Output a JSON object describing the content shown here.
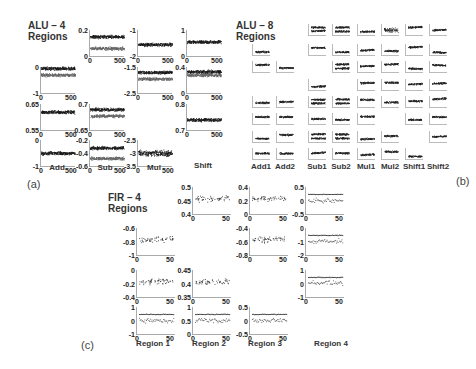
{
  "panels": {
    "a": {
      "label": "(a)",
      "title_line1": "ALU – 4",
      "title_line2": "Regions",
      "columns": [
        "Add",
        "Sub",
        "Mul",
        "Shift"
      ]
    },
    "b": {
      "label": "(b)",
      "title_line1": "ALU – 8",
      "title_line2": "Regions",
      "columns": [
        "Add1",
        "Add2",
        "Sub1",
        "Sub2",
        "Mul1",
        "Mul2",
        "Shift1",
        "Shift2"
      ]
    },
    "c": {
      "label": "(c)",
      "title_line1": "FIR – 4",
      "title_line2": "Regions",
      "columns": [
        "Region 1",
        "Region 2",
        "Region 3",
        "Region 4"
      ]
    }
  },
  "chart_data": [
    {
      "type": "scatter",
      "title": "ALU - 4 Regions",
      "panel": "(a)",
      "subplots": [
        {
          "column": "Add",
          "row": 2,
          "xlim": [
            0,
            500
          ],
          "ylim": [
            -1,
            0
          ],
          "yticks": [
            "0",
            "-1"
          ],
          "xticks": [
            "0",
            "500"
          ],
          "series_levels": [
            -0.05,
            -0.3
          ]
        },
        {
          "column": "Add",
          "row": 3,
          "xlim": [
            0,
            500
          ],
          "ylim": [
            0.55,
            0.65
          ],
          "yticks": [
            "0.65",
            "0.55"
          ],
          "xticks": [
            "0",
            "500"
          ],
          "series_levels": [
            0.62
          ]
        },
        {
          "column": "Add",
          "row": 4,
          "xlim": [
            0,
            500
          ],
          "ylim": [
            -1,
            0
          ],
          "yticks": [
            "0",
            "-1"
          ],
          "xticks": [
            "0",
            "500"
          ],
          "series_levels": [
            -0.5
          ]
        },
        {
          "column": "Sub",
          "row": 1,
          "xlim": [
            0,
            500
          ],
          "ylim": [
            0,
            0.2
          ],
          "yticks": [
            "0.2",
            "0"
          ],
          "xticks": [
            "0",
            "500"
          ],
          "series_levels": [
            0.15,
            0.06
          ]
        },
        {
          "column": "Sub",
          "row": 3,
          "xlim": [
            0,
            500
          ],
          "ylim": [
            0.6,
            0.7
          ],
          "yticks": [
            "0.7",
            "0.65"
          ],
          "xticks": [
            "0",
            "500"
          ],
          "series_levels": [
            0.68,
            0.655
          ]
        },
        {
          "column": "Sub",
          "row": 4,
          "xlim": [
            0,
            500
          ],
          "ylim": [
            -0.6,
            -0.2
          ],
          "yticks": [
            "-0.2",
            "-0.4",
            "-0.6"
          ],
          "xticks": [
            "0",
            "500"
          ],
          "series_levels": [
            -0.32,
            -0.48
          ]
        },
        {
          "column": "Mul",
          "row": 1,
          "xlim": [
            0,
            500
          ],
          "ylim": [
            -2,
            -1
          ],
          "yticks": [
            "-1",
            "-2"
          ],
          "xticks": [
            "0",
            "500"
          ],
          "series_levels": [
            -1.55
          ]
        },
        {
          "column": "Mul",
          "row": 2,
          "xlim": [
            0,
            500
          ],
          "ylim": [
            -2.5,
            -1.5
          ],
          "yticks": [
            "-1.5",
            "-2.5"
          ],
          "xticks": [
            "0",
            "500"
          ],
          "series_levels": [
            -1.7,
            -1.95
          ]
        },
        {
          "column": "Mul",
          "row": 4,
          "xlim": [
            0,
            500
          ],
          "ylim": [
            -3.5,
            -2.5
          ],
          "yticks": [
            "-2.5",
            "-3",
            "-3.5"
          ],
          "xticks": [
            "0",
            "500"
          ],
          "series_levels": [
            -3.0
          ]
        },
        {
          "column": "Shift",
          "row": 1,
          "xlim": [
            0,
            500
          ],
          "ylim": [
            0,
            1
          ],
          "yticks": [
            "1",
            "0"
          ],
          "xticks": [
            "0",
            "500"
          ],
          "series_levels": [
            0.55
          ]
        },
        {
          "column": "Shift",
          "row": 2,
          "xlim": [
            0,
            500
          ],
          "ylim": [
            0,
            0.4
          ],
          "yticks": [
            "0.4",
            "0"
          ],
          "xticks": [
            "0",
            "500"
          ],
          "series_levels": [
            0.33,
            0.28
          ]
        },
        {
          "column": "Shift",
          "row": 3,
          "xlim": [
            0,
            500
          ],
          "ylim": [
            0.7,
            0.8
          ],
          "yticks": [
            "0.8",
            "0.7"
          ],
          "xticks": [
            "0",
            "500"
          ],
          "series_levels": [
            0.74
          ]
        }
      ]
    },
    {
      "type": "scatter",
      "title": "ALU - 8 Regions",
      "panel": "(b)",
      "note": "8x8 grid of small scatter plots; tick labels too small to read",
      "columns": [
        "Add1",
        "Add2",
        "Sub1",
        "Sub2",
        "Mul1",
        "Mul2",
        "Shift1",
        "Shift2"
      ]
    },
    {
      "type": "scatter",
      "title": "FIR - 4 Regions",
      "panel": "(c)",
      "subplots": [
        {
          "column": "Region 1",
          "row": 2,
          "xlim": [
            0,
            50
          ],
          "ylim": [
            -1,
            -0.6
          ],
          "yticks": [
            "-0.6",
            "-0.8",
            "-1"
          ],
          "xticks": [
            "0",
            "50"
          ]
        },
        {
          "column": "Region 1",
          "row": 3,
          "xlim": [
            0,
            50
          ],
          "ylim": [
            -0.4,
            0
          ],
          "yticks": [
            "0",
            "-0.2",
            "-0.4"
          ],
          "xticks": [
            "0",
            "50"
          ]
        },
        {
          "column": "Region 1",
          "row": 4,
          "xlim": [
            0,
            50
          ],
          "ylim": [
            -1,
            1
          ],
          "yticks": [
            "1",
            "0",
            "-1"
          ],
          "xticks": [
            "0",
            "50"
          ]
        },
        {
          "column": "Region 2",
          "row": 1,
          "xlim": [
            0,
            50
          ],
          "ylim": [
            0.4,
            0.5
          ],
          "yticks": [
            "0.5",
            "0.45",
            "0.4"
          ],
          "xticks": [
            "0",
            "50"
          ]
        },
        {
          "column": "Region 2",
          "row": 3,
          "xlim": [
            0,
            50
          ],
          "ylim": [
            0.35,
            0.45
          ],
          "yticks": [
            "0.45",
            "0.4",
            "0.35"
          ],
          "xticks": [
            "0",
            "50"
          ]
        },
        {
          "column": "Region 2",
          "row": 4,
          "xlim": [
            0,
            50
          ],
          "ylim": [
            0,
            1
          ],
          "yticks": [
            "1",
            "0.5",
            "0"
          ],
          "xticks": [
            "0",
            "50"
          ]
        },
        {
          "column": "Region 3",
          "row": 1,
          "xlim": [
            0,
            50
          ],
          "ylim": [
            0,
            0.4
          ],
          "yticks": [
            "0.4",
            "0.2",
            "0"
          ],
          "xticks": [
            "0",
            "50"
          ]
        },
        {
          "column": "Region 3",
          "row": 2,
          "xlim": [
            0,
            50
          ],
          "ylim": [
            -0.8,
            -0.4
          ],
          "yticks": [
            "-0.4",
            "-0.6",
            "-0.8"
          ],
          "xticks": [
            "0",
            "50"
          ]
        },
        {
          "column": "Region 3",
          "row": 4,
          "xlim": [
            0,
            50
          ],
          "ylim": [
            -0.5,
            0.5
          ],
          "yticks": [
            "0.5",
            "0",
            "-0.5"
          ],
          "xticks": [
            "0",
            "50"
          ]
        },
        {
          "column": "Region 4",
          "row": 1,
          "xlim": [
            0,
            50
          ],
          "ylim": [
            -0.5,
            0.5
          ],
          "yticks": [
            "0.5",
            "0",
            "-0.5"
          ],
          "xticks": [
            "0",
            "50"
          ]
        },
        {
          "column": "Region 4",
          "row": 2,
          "xlim": [
            0,
            50
          ],
          "ylim": [
            -2,
            0
          ],
          "yticks": [
            "0",
            "-1",
            "-2"
          ],
          "xticks": [
            "0",
            "50"
          ]
        },
        {
          "column": "Region 4",
          "row": 3,
          "xlim": [
            0,
            50
          ],
          "ylim": [
            -1,
            1
          ],
          "yticks": [
            "1",
            "0",
            "-1"
          ],
          "xticks": [
            "0",
            "50"
          ]
        }
      ]
    }
  ]
}
